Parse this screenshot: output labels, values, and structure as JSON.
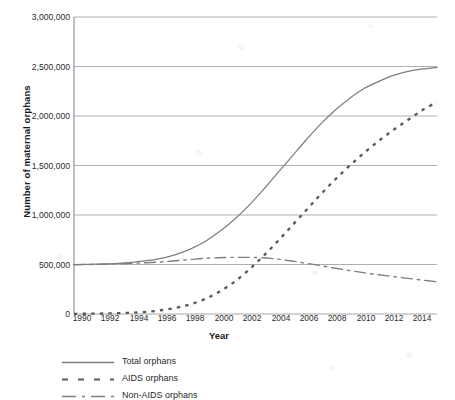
{
  "chart_data": {
    "type": "line",
    "title": "",
    "xlabel": "Year",
    "ylabel": "Number of maternal orphans",
    "xlim": [
      1990,
      2015
    ],
    "ylim": [
      0,
      3000000
    ],
    "grid": true,
    "legend_position": "below-left",
    "x_ticks": [
      "1990",
      "1992",
      "1994",
      "1996",
      "1998",
      "2000",
      "2002",
      "2004",
      "2006",
      "2008",
      "2010",
      "2012",
      "2014"
    ],
    "x_tick_values": [
      1990,
      1992,
      1994,
      1996,
      1998,
      2000,
      2002,
      2004,
      2006,
      2008,
      2010,
      2012,
      2014
    ],
    "y_ticks": [
      "0",
      "500,000",
      "1,000,000",
      "1,500,000",
      "2,000,000",
      "2,500,000",
      "3,000,000"
    ],
    "y_tick_values": [
      0,
      500000,
      1000000,
      1500000,
      2000000,
      2500000,
      3000000
    ],
    "x": [
      1990,
      1991,
      1992,
      1993,
      1994,
      1995,
      1996,
      1997,
      1998,
      1999,
      2000,
      2001,
      2002,
      2003,
      2004,
      2005,
      2006,
      2007,
      2008,
      2009,
      2010,
      2011,
      2012,
      2013,
      2014,
      2015
    ],
    "series": [
      {
        "name": "Total orphans",
        "style": "solid",
        "color": "#7f7f7f",
        "values": [
          500000,
          502000,
          506000,
          512000,
          522000,
          538000,
          562000,
          600000,
          655000,
          730000,
          830000,
          950000,
          1090000,
          1250000,
          1420000,
          1590000,
          1760000,
          1920000,
          2060000,
          2180000,
          2280000,
          2350000,
          2410000,
          2450000,
          2475000,
          2490000
        ]
      },
      {
        "name": "AIDS orphans",
        "style": "dashed",
        "color": "#595959",
        "values": [
          2000,
          3000,
          5000,
          8000,
          13000,
          22000,
          38000,
          62000,
          98000,
          150000,
          225000,
          320000,
          440000,
          580000,
          730000,
          890000,
          1050000,
          1210000,
          1360000,
          1500000,
          1630000,
          1750000,
          1860000,
          1960000,
          2060000,
          2140000
        ]
      },
      {
        "name": "Non-AIDS orphans",
        "style": "dash-dot",
        "color": "#7f7f7f",
        "values": [
          498000,
          500000,
          503000,
          507000,
          512000,
          518000,
          526000,
          538000,
          550000,
          562000,
          568000,
          572000,
          572000,
          568000,
          555000,
          535000,
          512000,
          488000,
          462000,
          438000,
          415000,
          396000,
          378000,
          360000,
          342000,
          325000
        ]
      }
    ]
  },
  "axes": {
    "axis_color": "#808080",
    "grid_color": "#a6a6a6"
  }
}
